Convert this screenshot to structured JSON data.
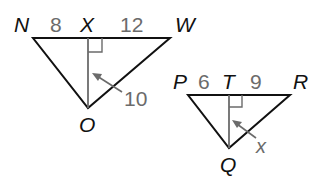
{
  "figure": {
    "colors": {
      "triangle_stroke": "#111111",
      "altitude_stroke": "#6b6b6b",
      "label_gray": "#6b6b6b",
      "vertex_label": "#111111"
    },
    "triangle_large": {
      "vertices": {
        "left": "N",
        "foot": "X",
        "right": "W",
        "bottom": "O"
      },
      "segments": {
        "NX": "8",
        "XW": "12",
        "altitude_XO": "10"
      }
    },
    "triangle_small": {
      "vertices": {
        "left": "P",
        "foot": "T",
        "right": "R",
        "bottom": "Q"
      },
      "segments": {
        "PT": "6",
        "TR": "9",
        "altitude_TQ": "x"
      }
    }
  }
}
